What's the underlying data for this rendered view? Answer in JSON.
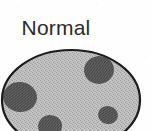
{
  "figure": {
    "caption": "Normal",
    "type": "biological-cell-diagram",
    "background_color": "#fefefe",
    "caption_color": "#2b2b2b",
    "cell": {
      "name": "cell-body",
      "shape": "ellipse",
      "fill_color": "#b9b9b9",
      "outline_color": "#1c1c1c",
      "outline_width": 2.2,
      "center_x": 71,
      "center_y": 100,
      "radius_x": 69,
      "radius_y": 50,
      "texture": "halftone-stipple",
      "cropped_edge": "bottom"
    },
    "inclusions": [
      {
        "name": "inclusion-upper-right",
        "center_x": 99,
        "center_y": 70,
        "radius_x": 15,
        "radius_y": 14,
        "fill_color": "#5f5f5f"
      },
      {
        "name": "inclusion-left",
        "center_x": 20,
        "center_y": 97,
        "radius_x": 17,
        "radius_y": 15,
        "fill_color": "#5f5f5f"
      },
      {
        "name": "inclusion-bottom",
        "center_x": 50,
        "center_y": 126,
        "radius_x": 12,
        "radius_y": 11,
        "fill_color": "#5f5f5f"
      },
      {
        "name": "inclusion-lower-right",
        "center_x": 108,
        "center_y": 115,
        "radius_x": 10,
        "radius_y": 9,
        "fill_color": "#5f5f5f"
      }
    ]
  }
}
